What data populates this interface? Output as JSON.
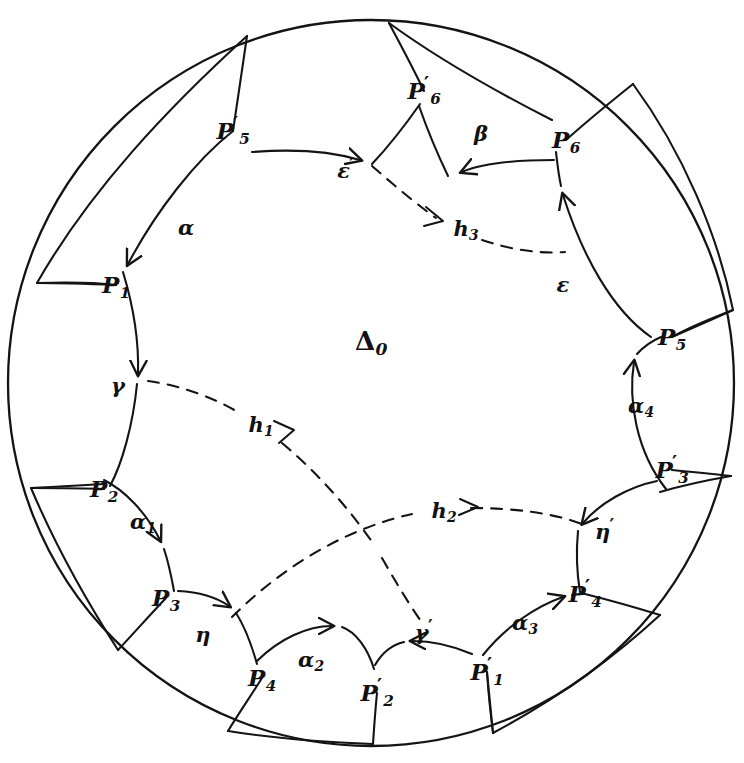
{
  "figure": {
    "kind": "poincare-disk-fundamental-domain",
    "center_region_label": "Δ",
    "center_region_sub": "0",
    "stroke_color": "#1a1a1a",
    "background_color": "#ffffff",
    "disk": {
      "cx": 371,
      "cy": 383,
      "r": 363
    }
  },
  "vertices": [
    {
      "id": "P5prime",
      "base": "P",
      "sub": "5",
      "prime": "′",
      "x": 233,
      "y": 131
    },
    {
      "id": "P6prime",
      "base": "P",
      "sub": "6",
      "prime": "′",
      "x": 424,
      "y": 91
    },
    {
      "id": "P6",
      "base": "P",
      "sub": "6",
      "prime": "",
      "x": 566,
      "y": 140
    },
    {
      "id": "P5",
      "base": "P",
      "sub": "5",
      "prime": "",
      "x": 672,
      "y": 337
    },
    {
      "id": "P3prime",
      "base": "P",
      "sub": "3",
      "prime": "′",
      "x": 672,
      "y": 470
    },
    {
      "id": "P4prime",
      "base": "P",
      "sub": "4",
      "prime": "′",
      "x": 585,
      "y": 594
    },
    {
      "id": "P1prime",
      "base": "P",
      "sub": "1",
      "prime": "′",
      "x": 487,
      "y": 672
    },
    {
      "id": "P2prime",
      "base": "P",
      "sub": "2",
      "prime": "′",
      "x": 377,
      "y": 693
    },
    {
      "id": "P4",
      "base": "P",
      "sub": "4",
      "prime": "",
      "x": 262,
      "y": 678
    },
    {
      "id": "P3",
      "base": "P",
      "sub": "3",
      "prime": "",
      "x": 166,
      "y": 598
    },
    {
      "id": "P2",
      "base": "P",
      "sub": "2",
      "prime": "",
      "x": 104,
      "y": 489
    },
    {
      "id": "P1",
      "base": "P",
      "sub": "1",
      "prime": "",
      "x": 116,
      "y": 285
    }
  ],
  "edge_labels": [
    {
      "id": "alpha",
      "base": "α",
      "sub": "",
      "prime": "",
      "x": 186,
      "y": 227
    },
    {
      "id": "epsilonPrime",
      "base": "ε",
      "sub": "",
      "prime": "′",
      "x": 346,
      "y": 170
    },
    {
      "id": "beta",
      "base": "β",
      "sub": "",
      "prime": "",
      "x": 481,
      "y": 133
    },
    {
      "id": "epsilon",
      "base": "ε",
      "sub": "",
      "prime": "",
      "x": 563,
      "y": 284
    },
    {
      "id": "alpha4",
      "base": "α",
      "sub": "4",
      "prime": "",
      "x": 641,
      "y": 405
    },
    {
      "id": "etaPrime",
      "base": "η",
      "sub": "",
      "prime": "′",
      "x": 605,
      "y": 531
    },
    {
      "id": "alpha3",
      "base": "α",
      "sub": "3",
      "prime": "",
      "x": 525,
      "y": 622
    },
    {
      "id": "gammaPrime",
      "base": "γ",
      "sub": "",
      "prime": "′",
      "x": 424,
      "y": 632
    },
    {
      "id": "alpha2",
      "base": "α",
      "sub": "2",
      "prime": "",
      "x": 311,
      "y": 659
    },
    {
      "id": "eta",
      "base": "η",
      "sub": "",
      "prime": "",
      "x": 203,
      "y": 634
    },
    {
      "id": "alpha1",
      "base": "α",
      "sub": "1",
      "prime": "",
      "x": 143,
      "y": 521
    },
    {
      "id": "gamma",
      "base": "γ",
      "sub": "",
      "prime": "",
      "x": 118,
      "y": 385
    }
  ],
  "geodesic_labels": [
    {
      "id": "h3",
      "base": "h",
      "sub": "3",
      "x": 466,
      "y": 228
    },
    {
      "id": "h1",
      "base": "h",
      "sub": "1",
      "x": 261,
      "y": 424
    },
    {
      "id": "h2",
      "base": "h",
      "sub": "2",
      "x": 444,
      "y": 510
    }
  ],
  "arcs": {
    "solid_note": "twelve boundary geodesic arcs of the fundamental polygon plus twelve radial arcs to the disk boundary",
    "dashed_note": "three dashed translation/identification geodesics h1 h2 h3"
  }
}
